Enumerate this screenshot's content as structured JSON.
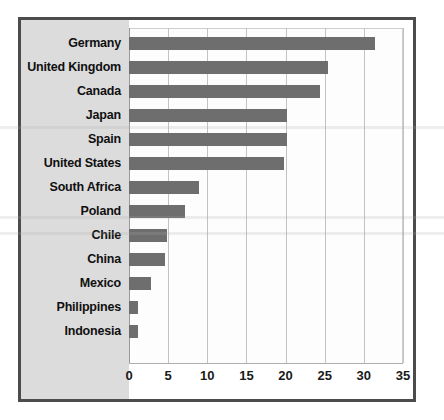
{
  "chart_data": {
    "type": "bar",
    "orientation": "horizontal",
    "title": "",
    "subtitle": "",
    "xlabel": "",
    "ylabel": "",
    "xlim": [
      0,
      35
    ],
    "xticks": [
      "0",
      "5",
      "10",
      "15",
      "20",
      "25",
      "30",
      "35"
    ],
    "xtick_values": [
      0,
      5,
      10,
      15,
      20,
      25,
      30,
      35
    ],
    "grid": true,
    "legend": false,
    "legend_position": "none",
    "bar_color": "#6e6e6e",
    "categories": [
      "Germany",
      "United Kingdom",
      "Canada",
      "Japan",
      "Spain",
      "United States",
      "South Africa",
      "Poland",
      "Chile",
      "China",
      "Mexico",
      "Philippines",
      "Indonesia"
    ],
    "values": [
      31.4,
      25.4,
      24.4,
      20.2,
      20.2,
      19.8,
      9.0,
      7.2,
      4.8,
      4.6,
      2.8,
      1.2,
      1.2
    ]
  },
  "colors": {
    "frame": "#4c4c4c",
    "label_panel": "#dcdcdc",
    "plot_background": "#fdfdfd",
    "gridline": "#c2c2c2",
    "axis": "#9a9a9a",
    "bar": "#6e6e6e",
    "text": "#101010"
  }
}
